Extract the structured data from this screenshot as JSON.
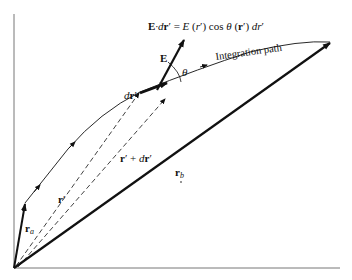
{
  "diagram": {
    "equation": {
      "E_bold": "E",
      "dot_dr": "·d",
      "r_bold": "r",
      "prime_eq": "′ = ",
      "E_italic": "E",
      "rest1": " (",
      "r_italic": "r",
      "rest2": "′) cos ",
      "theta": "θ",
      "rest3": " (",
      "r_bold2": "r",
      "rest4": "′) ",
      "dr_italic": "dr",
      "rest5": "′"
    },
    "labels": {
      "E_vector": "E",
      "theta": "θ",
      "integration_path": "Integration path",
      "dr_prime_d": "d",
      "dr_prime_r": "r",
      "dr_prime_p": "′",
      "r_prime_plus_dr_r": "r",
      "r_prime_plus_dr_rest": "′ + ",
      "r_prime_plus_dr_d": "d",
      "r_prime_plus_dr_r2": "r",
      "r_prime_plus_dr_p": "′",
      "r_prime_r": "r",
      "r_prime_p": "′",
      "r_a_r": "r",
      "r_a_sub": "a",
      "r_b_r": "r",
      "r_b_sub": "b"
    },
    "colors": {
      "ink": "#111111",
      "axis": "#666666"
    }
  }
}
